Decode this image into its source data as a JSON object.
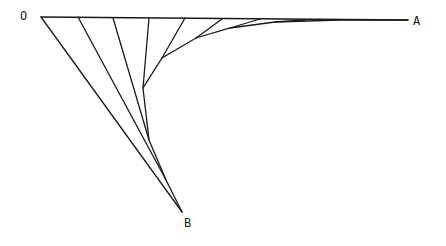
{
  "diagram": {
    "labels": {
      "o": "O",
      "a": "A",
      "b": "B"
    },
    "stroke_color": "#1a1a1a",
    "background": "#ffffff",
    "points": {
      "O": [
        41,
        17
      ],
      "A": [
        408,
        20
      ],
      "B": [
        182,
        212
      ]
    },
    "curve_points": [
      [
        182,
        212
      ],
      [
        166,
        180
      ],
      [
        149,
        140
      ],
      [
        143,
        88
      ],
      [
        162,
        58
      ],
      [
        196,
        38
      ],
      [
        230,
        28
      ],
      [
        275,
        22
      ],
      [
        340,
        20
      ]
    ],
    "top_anchors": [
      [
        78,
        17
      ],
      [
        113,
        18
      ],
      [
        149,
        18
      ],
      [
        185,
        18
      ],
      [
        222,
        19
      ],
      [
        260,
        19
      ],
      [
        305,
        20
      ]
    ]
  }
}
